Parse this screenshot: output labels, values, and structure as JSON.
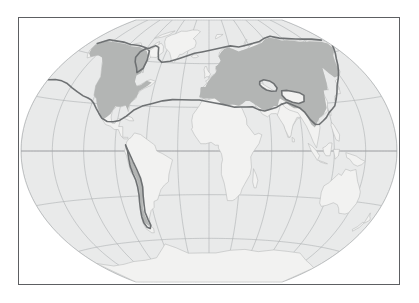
{
  "figure": {
    "title": "World map showing shaded distribution range",
    "width": 419,
    "height": 303,
    "background_color": "#ffffff"
  },
  "frame": {
    "border_color": "#5d5f62",
    "border_width_px": 1,
    "fill_color": "#ffffff"
  },
  "map": {
    "projection": "winkel-tripel",
    "ocean_color": "#e9eaea",
    "land_unshaded_color": "#f2f2f1",
    "land_shaded_color": "#b3b5b4",
    "coastline_color": "#b9bcbb",
    "graticule_color": "#a9abad",
    "range_outline_color": "#6e7173",
    "range_outline_width_px": 1.6,
    "graticule": {
      "visible": true,
      "meridian_interval_deg": 30,
      "parallel_interval_deg": 30,
      "labels_visible": false,
      "lon_range": [
        -180,
        180
      ],
      "lat_range": [
        -90,
        90
      ]
    },
    "legend": {
      "visible": false,
      "entries": [
        {
          "name": "shaded-range",
          "label": "Range",
          "color": "#b3b5b4"
        },
        {
          "name": "range-boundary",
          "label": "Range boundary",
          "color": "#6e7173"
        }
      ]
    },
    "scalebar": {
      "visible": false
    },
    "north_arrow": {
      "visible": false
    },
    "regions_shaded": [
      "North America",
      "Andes (western South America)",
      "Europe",
      "Northern Africa coast",
      "Russia",
      "Central and East Asia",
      "China"
    ],
    "regions_unshaded": [
      "Greenland",
      "Arctic islands",
      "Sub-Saharan Africa",
      "Amazon and eastern South America",
      "Arabian Peninsula",
      "Central Asian deserts",
      "Tibetan Plateau",
      "India",
      "Southeast Asia",
      "Australia",
      "Antarctica"
    ]
  }
}
